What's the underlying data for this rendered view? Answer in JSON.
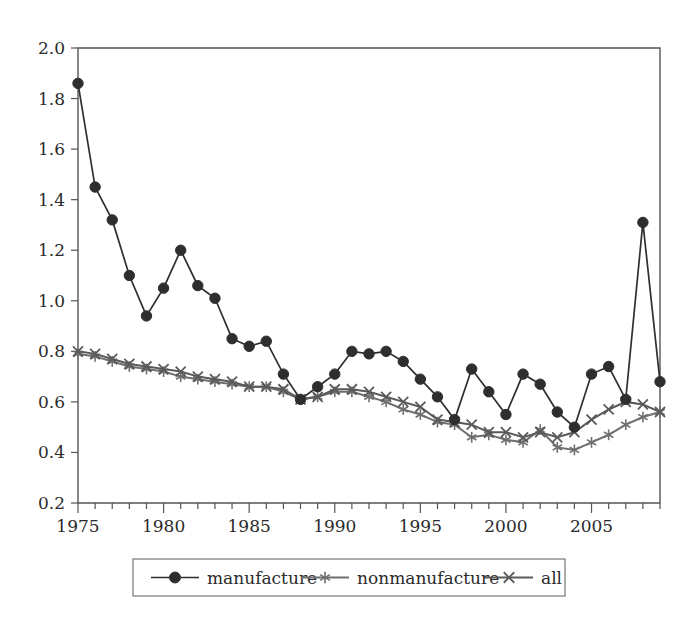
{
  "chart_data": {
    "type": "line",
    "title": "",
    "subtitle": "",
    "xlabel": "",
    "ylabel": "",
    "xlim": [
      1975,
      2009
    ],
    "ylim": [
      0.2,
      2.0
    ],
    "grid": false,
    "legend_position": "bottom",
    "x": [
      1975,
      1976,
      1977,
      1978,
      1979,
      1980,
      1981,
      1982,
      1983,
      1984,
      1985,
      1986,
      1987,
      1988,
      1989,
      1990,
      1991,
      1992,
      1993,
      1994,
      1995,
      1996,
      1997,
      1998,
      1999,
      2000,
      2001,
      2002,
      2003,
      2004,
      2005,
      2006,
      2007,
      2008,
      2009
    ],
    "xticks": [
      1975,
      1980,
      1985,
      1990,
      1995,
      2000,
      2005
    ],
    "xticklabels": [
      "1975",
      "1980",
      "1985",
      "1990",
      "1995",
      "2000",
      "2005"
    ],
    "xminorticks": [
      1976,
      1977,
      1978,
      1979,
      1981,
      1982,
      1983,
      1984,
      1986,
      1987,
      1988,
      1989,
      1991,
      1992,
      1993,
      1994,
      1996,
      1997,
      1998,
      1999,
      2001,
      2002,
      2003,
      2004,
      2006,
      2007,
      2008,
      2009
    ],
    "yticks": [
      0.2,
      0.4,
      0.6,
      0.8,
      1.0,
      1.2,
      1.4,
      1.6,
      1.8,
      2.0
    ],
    "yticklabels": [
      "0.2",
      "0.4",
      "0.6",
      "0.8",
      "1.0",
      "1.2",
      "1.4",
      "1.6",
      "1.8",
      "2.0"
    ],
    "series": [
      {
        "name": "manufacture",
        "marker": "circle",
        "color": "#2e2e2e",
        "values": [
          1.86,
          1.45,
          1.32,
          1.1,
          0.94,
          1.05,
          1.2,
          1.06,
          1.01,
          0.85,
          0.82,
          0.84,
          0.71,
          0.61,
          0.66,
          0.71,
          0.8,
          0.79,
          0.8,
          0.76,
          0.69,
          0.62,
          0.53,
          0.73,
          0.64,
          0.55,
          0.71,
          0.67,
          0.56,
          0.5,
          0.71,
          0.74,
          0.61,
          1.31,
          0.68
        ]
      },
      {
        "name": "nonmanufacture",
        "marker": "star",
        "color": "#6f6f6f",
        "values": [
          0.79,
          0.78,
          0.76,
          0.74,
          0.73,
          0.72,
          0.7,
          0.69,
          0.68,
          0.67,
          0.66,
          0.66,
          0.64,
          0.61,
          0.62,
          0.64,
          0.64,
          0.62,
          0.6,
          0.57,
          0.55,
          0.52,
          0.51,
          0.46,
          0.47,
          0.45,
          0.44,
          0.49,
          0.42,
          0.41,
          0.44,
          0.47,
          0.51,
          0.54,
          0.56
        ]
      },
      {
        "name": "all",
        "marker": "cross",
        "color": "#5a5a5a",
        "values": [
          0.8,
          0.79,
          0.77,
          0.75,
          0.74,
          0.73,
          0.72,
          0.7,
          0.69,
          0.68,
          0.66,
          0.66,
          0.65,
          0.61,
          0.62,
          0.65,
          0.65,
          0.64,
          0.62,
          0.6,
          0.58,
          0.53,
          0.52,
          0.51,
          0.48,
          0.48,
          0.46,
          0.48,
          0.46,
          0.48,
          0.53,
          0.57,
          0.6,
          0.59,
          0.56
        ]
      }
    ]
  },
  "legend": {
    "items": [
      {
        "label": "manufacture",
        "marker": "circle-marker-icon"
      },
      {
        "label": "nonmanufacture",
        "marker": "star-marker-icon"
      },
      {
        "label": "all",
        "marker": "cross-marker-icon"
      }
    ]
  }
}
